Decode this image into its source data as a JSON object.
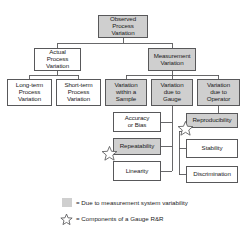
{
  "diagram": {
    "colors": {
      "shaded_fill": "#cfcfcf",
      "white_fill": "#ffffff",
      "border": "#58585a",
      "text": "#1b1b1b",
      "connector": "#58585a"
    },
    "nodes": [
      {
        "id": "observed-process-variation",
        "label": "Observed\nProcess\nVariation",
        "fill": "shaded",
        "level": 0,
        "x": 98,
        "y": 15,
        "w": 50,
        "h": 23,
        "font": 6.2
      },
      {
        "id": "actual-process-variation",
        "label": "Actual\nProcess\nVariation",
        "fill": "white",
        "level": 1,
        "x": 34,
        "y": 48,
        "w": 47,
        "h": 23,
        "font": 6.2
      },
      {
        "id": "measurement-variation",
        "label": "Measurement\nVariation",
        "fill": "shaded",
        "level": 1,
        "x": 148,
        "y": 48,
        "w": 48,
        "h": 23,
        "font": 6.2
      },
      {
        "id": "long-term-process-variation",
        "label": "Long-term\nProcess\nVariation",
        "fill": "white",
        "level": 2,
        "x": 7,
        "y": 79,
        "w": 45,
        "h": 27,
        "font": 6.2
      },
      {
        "id": "short-term-process-variation",
        "label": "Short-term\nProcess\nVariation",
        "fill": "white",
        "level": 2,
        "x": 56,
        "y": 79,
        "w": 45,
        "h": 27,
        "font": 6.2
      },
      {
        "id": "variation-within-a-sample",
        "label": "Variation\nwithin a\nSample",
        "fill": "shaded",
        "level": 2,
        "x": 105,
        "y": 79,
        "w": 42,
        "h": 27,
        "font": 6.2
      },
      {
        "id": "variation-due-to-gauge",
        "label": "Variation\ndue to\nGauge",
        "fill": "shaded",
        "level": 2,
        "x": 151,
        "y": 79,
        "w": 42,
        "h": 27,
        "font": 6.2
      },
      {
        "id": "variation-due-to-operator",
        "label": "Variation\ndue to\nOperator",
        "fill": "shaded",
        "level": 2,
        "x": 197,
        "y": 79,
        "w": 43,
        "h": 27,
        "font": 6.2
      },
      {
        "id": "accuracy-or-bias",
        "label": "Accuracy\nor Bias",
        "fill": "white",
        "level": 3,
        "x": 113,
        "y": 112,
        "w": 48,
        "h": 20,
        "font": 6.2
      },
      {
        "id": "repeatability",
        "label": "Repeatability",
        "fill": "shaded",
        "level": 3,
        "x": 113,
        "y": 138,
        "w": 48,
        "h": 17,
        "font": 6.2
      },
      {
        "id": "linearity",
        "label": "Linearity",
        "fill": "white",
        "level": 3,
        "x": 113,
        "y": 161,
        "w": 48,
        "h": 20,
        "font": 6.2
      },
      {
        "id": "reproducibility",
        "label": "Reproducibility",
        "fill": "shaded",
        "level": 3,
        "x": 186,
        "y": 113,
        "w": 52,
        "h": 15,
        "font": 6.2
      },
      {
        "id": "stability",
        "label": "Stability",
        "fill": "white",
        "level": 3,
        "x": 186,
        "y": 139,
        "w": 52,
        "h": 19,
        "font": 6.2
      },
      {
        "id": "discrimination",
        "label": "Discrimination",
        "fill": "white",
        "level": 3,
        "x": 186,
        "y": 166,
        "w": 52,
        "h": 17,
        "font": 6.2
      }
    ],
    "stars": [
      {
        "id": "star-repeatability",
        "x": 101,
        "y": 145,
        "size": 17
      },
      {
        "id": "star-reproducibility",
        "x": 177,
        "y": 120,
        "size": 17
      }
    ],
    "legend": [
      {
        "id": "legend-shaded",
        "marker": "swatch",
        "text": "= Due to measurement system variability"
      },
      {
        "id": "legend-star",
        "marker": "star",
        "text": "= Components of a Gauge R&R"
      }
    ]
  }
}
